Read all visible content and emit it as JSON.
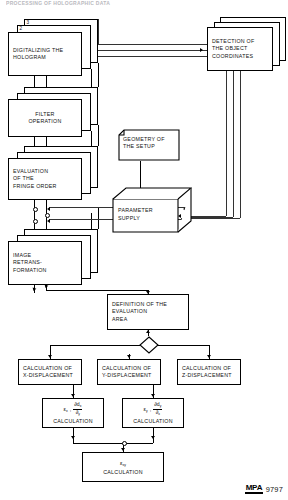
{
  "header": {
    "clipped_title": "PROCESSING OF HOLOGRAPHIC DATA"
  },
  "diagram": {
    "type": "flowchart",
    "nodes": {
      "digitalizing": {
        "lines": [
          "DIGITALIZING THE",
          "HOLOGRAM"
        ],
        "stack_labels": [
          "1",
          "2",
          "3"
        ]
      },
      "filter": {
        "lines": [
          "FILTER",
          "OPERATION"
        ]
      },
      "fringe": {
        "lines": [
          "EVALUATION",
          "OF THE",
          "FRINGE ORDER"
        ]
      },
      "retrans": {
        "lines": [
          "IMAGE",
          "RETRANS-",
          "FORMATION"
        ]
      },
      "detection": {
        "lines": [
          "DETECTION OF",
          "THE OBJECT",
          "COORDINATES"
        ]
      },
      "geometry": {
        "lines": [
          "GEOMETRY OF",
          "THE SETUP"
        ]
      },
      "parameter": {
        "lines": [
          "PARAMETER",
          "SUPPLY"
        ]
      },
      "definition": {
        "lines": [
          "DEFINITION OF  THE",
          "EVALUATION",
          "AREA"
        ]
      },
      "calc_x": {
        "lines": [
          "CALCULATION OF",
          "X-DISPLACEMENT"
        ]
      },
      "calc_y": {
        "lines": [
          "CALCULATION OF",
          "Y-DISPLACEMENT"
        ]
      },
      "calc_z": {
        "lines": [
          "CALCULATION OF",
          "Z-DISPLACEMENT"
        ]
      },
      "eps_x": {
        "symbol": "ε",
        "symbol_sub": "x",
        "frac_num": "∂d",
        "frac_num_sub": "x",
        "frac_den": "∂",
        "frac_den_sub": "y",
        "caption": "CALCULATION"
      },
      "eps_y": {
        "symbol": "ε",
        "symbol_sub": "y",
        "frac_num": "∂d",
        "frac_num_sub": "y",
        "frac_den": "∂",
        "frac_den_sub": "x",
        "caption": "CALCULATION"
      },
      "eps_xy": {
        "symbol": "ε",
        "symbol_sub": "xy",
        "caption": "CALCULATION"
      }
    }
  },
  "footer": {
    "logo": "MPA",
    "number": "9797"
  },
  "colors": {
    "line": "#000000",
    "background": "#ffffff",
    "header_ghost": "#b9b9be"
  }
}
